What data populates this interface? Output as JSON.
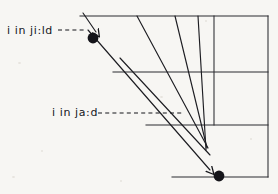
{
  "figure": {
    "background_color": "#f7f6f3",
    "ink_color": "#15151a",
    "labels": [
      {
        "id": "yield",
        "text": "i in ji:ld",
        "x": 7,
        "y": 25,
        "leader": "dashed",
        "points_to": "upper-dot"
      },
      {
        "id": "yard",
        "text": "i in ja:d",
        "x": 52,
        "y": 107,
        "leader": "dashed",
        "points_to": "mid-line"
      }
    ],
    "markers": [
      {
        "id": "upper-dot",
        "x": 93,
        "y": 38,
        "r": 5.5,
        "fill": "#15151a"
      },
      {
        "id": "lower-dot",
        "x": 219,
        "y": 176,
        "r": 5.5,
        "fill": "#15151a"
      }
    ],
    "grid": {
      "top_rule": {
        "x1": 80,
        "y1": 16,
        "x2": 268,
        "y2": 16
      },
      "mid_rule": {
        "x1": 113,
        "y1": 72,
        "x2": 268,
        "y2": 72
      },
      "low_rule": {
        "x1": 146,
        "y1": 125,
        "x2": 268,
        "y2": 125
      },
      "bottom_rule": {
        "x1": 172,
        "y1": 177,
        "x2": 268,
        "y2": 177
      },
      "right_edge": {
        "x1": 268,
        "y1": 16,
        "x2": 268,
        "y2": 177
      },
      "inner_vert": {
        "x1": 214,
        "y1": 16,
        "x2": 214,
        "y2": 125
      }
    },
    "glide_strokes": [
      {
        "id": "stroke-outer-left",
        "x1": 88,
        "y1": 30,
        "x2": 212,
        "y2": 172,
        "arrow": true
      },
      {
        "id": "stroke-inner-left",
        "x1": 120,
        "y1": 58,
        "x2": 210,
        "y2": 155,
        "arrow": false
      },
      {
        "id": "stroke-mid-1",
        "x1": 137,
        "y1": 16,
        "x2": 208,
        "y2": 148,
        "arrow": false
      },
      {
        "id": "stroke-mid-2",
        "x1": 175,
        "y1": 16,
        "x2": 207,
        "y2": 148,
        "arrow": false
      },
      {
        "id": "stroke-mid-3",
        "x1": 198,
        "y1": 16,
        "x2": 206,
        "y2": 150,
        "arrow": false
      },
      {
        "id": "stroke-hook-top",
        "x1": 84,
        "y1": 14,
        "x2": 98,
        "y2": 34,
        "arrow": true
      }
    ],
    "leaders": [
      {
        "id": "leader-yield",
        "x1": 58,
        "y1": 30,
        "x2": 87,
        "y2": 30
      },
      {
        "id": "leader-yard",
        "x1": 98,
        "y1": 113,
        "x2": 180,
        "y2": 113
      }
    ]
  }
}
